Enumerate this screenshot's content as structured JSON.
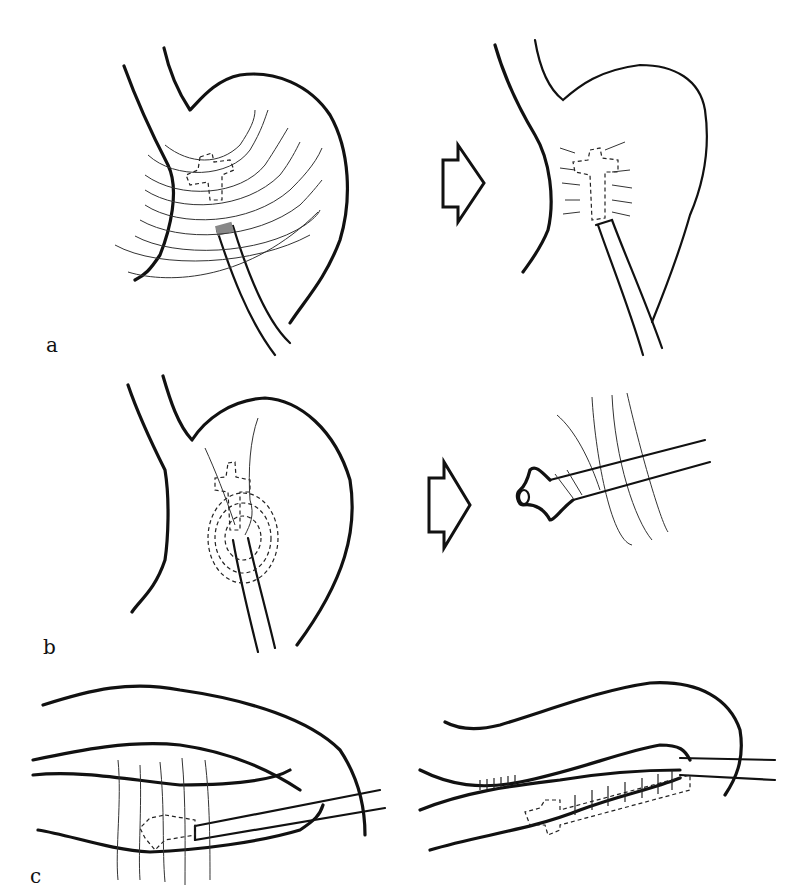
{
  "figure": {
    "panels": [
      {
        "id": "a",
        "label": "a",
        "description": "Stomach with transmural sutures placed around flanged tube; after tying, sutures form a tunnel around the tube"
      },
      {
        "id": "b",
        "label": "b",
        "description": "Stomach with flanged tube inserted through wall with concentric purse-string markings; enlarged view of flanged tube through abdominal wall layers"
      },
      {
        "id": "c",
        "label": "c",
        "description": "Longitudinal view of bowel with sutures placed over tube; after closure, tube tunnelled within sutured serosal fold"
      }
    ],
    "arrows": [
      {
        "from": "a-left",
        "to": "a-right"
      },
      {
        "from": "b-left",
        "to": "b-right"
      }
    ],
    "colors": {
      "ink": "#111111",
      "background": "#ffffff"
    }
  }
}
